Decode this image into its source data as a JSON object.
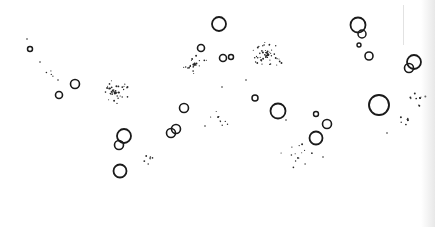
{
  "figure": {
    "width": 435,
    "height": 227,
    "background": "#ffffff",
    "stroke_color": "#1a1a1a",
    "dot_color": "#2a2a2a",
    "circles": [
      {
        "cx": 30,
        "cy": 49,
        "r": 2.5,
        "w": 1.5
      },
      {
        "cx": 59,
        "cy": 95,
        "r": 3.5,
        "w": 1.6
      },
      {
        "cx": 75,
        "cy": 84,
        "r": 4.5,
        "w": 1.6
      },
      {
        "cx": 124,
        "cy": 136,
        "r": 7,
        "w": 1.8
      },
      {
        "cx": 119,
        "cy": 145,
        "r": 4.5,
        "w": 1.6
      },
      {
        "cx": 120,
        "cy": 171,
        "r": 6.5,
        "w": 1.8
      },
      {
        "cx": 219,
        "cy": 24,
        "r": 7,
        "w": 1.8
      },
      {
        "cx": 201,
        "cy": 48,
        "r": 3.5,
        "w": 1.6
      },
      {
        "cx": 223,
        "cy": 58,
        "r": 3.5,
        "w": 1.6
      },
      {
        "cx": 231,
        "cy": 57,
        "r": 2.5,
        "w": 1.5
      },
      {
        "cx": 184,
        "cy": 108,
        "r": 4.5,
        "w": 1.6
      },
      {
        "cx": 176,
        "cy": 129,
        "r": 4.5,
        "w": 1.6
      },
      {
        "cx": 171,
        "cy": 133,
        "r": 4.5,
        "w": 1.6
      },
      {
        "cx": 255,
        "cy": 98,
        "r": 3,
        "w": 1.5
      },
      {
        "cx": 278,
        "cy": 111,
        "r": 7.5,
        "w": 1.8
      },
      {
        "cx": 316,
        "cy": 114,
        "r": 2.5,
        "w": 1.4
      },
      {
        "cx": 327,
        "cy": 124,
        "r": 4.5,
        "w": 1.6
      },
      {
        "cx": 316,
        "cy": 138,
        "r": 6.5,
        "w": 1.8
      },
      {
        "cx": 358,
        "cy": 25,
        "r": 7.5,
        "w": 1.8
      },
      {
        "cx": 362,
        "cy": 34,
        "r": 4,
        "w": 1.5
      },
      {
        "cx": 359,
        "cy": 45,
        "r": 2,
        "w": 1.4
      },
      {
        "cx": 369,
        "cy": 56,
        "r": 4,
        "w": 1.6
      },
      {
        "cx": 379,
        "cy": 105,
        "r": 10,
        "w": 1.9
      },
      {
        "cx": 414,
        "cy": 62,
        "r": 7,
        "w": 1.8
      },
      {
        "cx": 409,
        "cy": 68,
        "r": 4.5,
        "w": 1.6
      }
    ],
    "clusters": [
      {
        "cx": 114,
        "cy": 92,
        "spread": 10,
        "count": 45,
        "seed": 3
      },
      {
        "cx": 195,
        "cy": 64,
        "spread": 8,
        "count": 30,
        "seed": 7
      },
      {
        "cx": 268,
        "cy": 55,
        "spread": 11,
        "count": 55,
        "seed": 11
      },
      {
        "cx": 50,
        "cy": 74,
        "spread": 3,
        "count": 4,
        "seed": 13
      },
      {
        "cx": 218,
        "cy": 117,
        "spread": 9,
        "count": 10,
        "seed": 17
      },
      {
        "cx": 150,
        "cy": 158,
        "spread": 5,
        "count": 8,
        "seed": 19
      },
      {
        "cx": 298,
        "cy": 158,
        "spread": 12,
        "count": 14,
        "seed": 23
      },
      {
        "cx": 420,
        "cy": 98,
        "spread": 7,
        "count": 14,
        "seed": 29
      },
      {
        "cx": 408,
        "cy": 120,
        "spread": 6,
        "count": 8,
        "seed": 31
      }
    ],
    "stray_dots": [
      {
        "x": 27,
        "y": 39
      },
      {
        "x": 40,
        "y": 62
      },
      {
        "x": 58,
        "y": 80
      },
      {
        "x": 205,
        "y": 126
      },
      {
        "x": 222,
        "y": 87
      },
      {
        "x": 286,
        "y": 120
      },
      {
        "x": 323,
        "y": 157
      },
      {
        "x": 387,
        "y": 133
      },
      {
        "x": 246,
        "y": 80
      }
    ]
  }
}
